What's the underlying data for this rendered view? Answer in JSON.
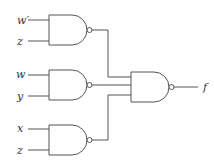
{
  "diagram": {
    "type": "logic-circuit",
    "gates": [
      {
        "id": "nand1",
        "type": "NAND",
        "inputs": [
          "w'",
          "z"
        ]
      },
      {
        "id": "nand2",
        "type": "NAND",
        "inputs": [
          "w",
          "y"
        ]
      },
      {
        "id": "nand3",
        "type": "NAND",
        "inputs": [
          "x",
          "z"
        ]
      },
      {
        "id": "nand_out",
        "type": "NAND",
        "inputs": [
          "nand1",
          "nand2",
          "nand3"
        ],
        "output": "f"
      }
    ],
    "labels": {
      "in1a": "w′",
      "in1b": "z",
      "in2a": "w",
      "in2b": "y",
      "in3a": "x",
      "in3b": "z",
      "out": "f"
    }
  }
}
